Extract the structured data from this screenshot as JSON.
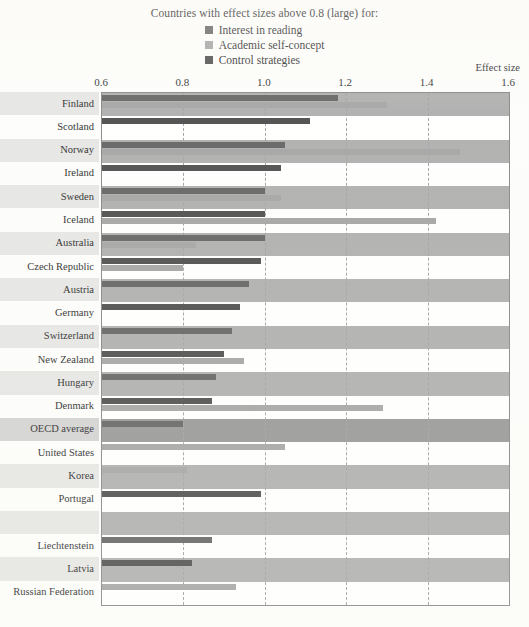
{
  "legend": {
    "title": "Countries with effect sizes above 0.8 (large) for:",
    "entries": [
      {
        "label": "Interest in reading",
        "color": "#575757",
        "swatch": "legend-swatch-interest-in-reading"
      },
      {
        "label": "Academic self-concept",
        "color": "#9d9d9d",
        "swatch": "legend-swatch-academic-self-concept"
      },
      {
        "label": "Control strategies",
        "color": "#3f3f3f",
        "swatch": "legend-swatch-control-strategies"
      }
    ]
  },
  "axis": {
    "title": "Effect size",
    "ticks": [
      "0.6",
      "0.8",
      "1.0",
      "1.2",
      "1.4",
      "1.6"
    ],
    "gridlines": [
      "0.8",
      "1.0",
      "1.2",
      "1.4"
    ]
  },
  "chart_data": {
    "type": "bar",
    "title": "Countries with effect sizes above 0.8 (large) for:",
    "xlabel": "Effect size",
    "ylabel": "",
    "orientation": "horizontal",
    "xlim": [
      0.6,
      1.6
    ],
    "xticks": [
      0.6,
      0.8,
      1.0,
      1.2,
      1.4,
      1.6
    ],
    "grid": true,
    "legend_position": "top-center",
    "series": [
      {
        "name": "Interest in reading",
        "color": "#575757"
      },
      {
        "name": "Academic self-concept",
        "color": "#9d9d9d"
      },
      {
        "name": "Control strategies",
        "color": "#3f3f3f"
      }
    ],
    "categories": [
      "Finland",
      "Scotland",
      "Norway",
      "Ireland",
      "Sweden",
      "Iceland",
      "Australia",
      "Czech Republic",
      "Austria",
      "Germany",
      "Switzerland",
      "New Zealand",
      "Hungary",
      "Denmark",
      "OECD average",
      "United States",
      "Korea",
      "Portugal",
      "",
      "Liechtenstein",
      "Latvia",
      "Russian Federation"
    ],
    "rows": [
      {
        "country": "Finland",
        "band": "shade",
        "bars": [
          {
            "series": "Interest in reading",
            "value": 1.18
          },
          {
            "series": "Academic self-concept",
            "value": 1.3
          }
        ]
      },
      {
        "country": "Scotland",
        "band": "light",
        "bars": [
          {
            "series": "Control strategies",
            "value": 1.11
          }
        ]
      },
      {
        "country": "Norway",
        "band": "shade",
        "bars": [
          {
            "series": "Interest in reading",
            "value": 1.05
          },
          {
            "series": "Academic self-concept",
            "value": 1.48
          }
        ]
      },
      {
        "country": "Ireland",
        "band": "light",
        "bars": [
          {
            "series": "Control strategies",
            "value": 1.04
          }
        ]
      },
      {
        "country": "Sweden",
        "band": "shade",
        "bars": [
          {
            "series": "Interest in reading",
            "value": 1.0
          },
          {
            "series": "Academic self-concept",
            "value": 1.04
          }
        ]
      },
      {
        "country": "Iceland",
        "band": "light",
        "bars": [
          {
            "series": "Control strategies",
            "value": 1.0
          },
          {
            "series": "Academic self-concept",
            "value": 1.42
          }
        ]
      },
      {
        "country": "Australia",
        "band": "shade",
        "bars": [
          {
            "series": "Interest in reading",
            "value": 1.0
          },
          {
            "series": "Academic self-concept",
            "value": 0.83
          }
        ]
      },
      {
        "country": "Czech Republic",
        "band": "light",
        "bars": [
          {
            "series": "Control strategies",
            "value": 0.99
          },
          {
            "series": "Academic self-concept",
            "value": 0.8
          }
        ]
      },
      {
        "country": "Austria",
        "band": "shade",
        "bars": [
          {
            "series": "Interest in reading",
            "value": 0.96
          }
        ]
      },
      {
        "country": "Germany",
        "band": "light",
        "bars": [
          {
            "series": "Control strategies",
            "value": 0.94
          }
        ]
      },
      {
        "country": "Switzerland",
        "band": "shade",
        "bars": [
          {
            "series": "Interest in reading",
            "value": 0.92
          }
        ]
      },
      {
        "country": "New Zealand",
        "band": "light",
        "bars": [
          {
            "series": "Control strategies",
            "value": 0.9
          },
          {
            "series": "Academic self-concept",
            "value": 0.95
          }
        ]
      },
      {
        "country": "Hungary",
        "band": "shade",
        "bars": [
          {
            "series": "Interest in reading",
            "value": 0.88
          }
        ]
      },
      {
        "country": "Denmark",
        "band": "light",
        "bars": [
          {
            "series": "Control strategies",
            "value": 0.87
          },
          {
            "series": "Academic self-concept",
            "value": 1.29
          }
        ]
      },
      {
        "country": "OECD average",
        "band": "dark",
        "bars": [
          {
            "series": "Interest in reading",
            "value": 0.8
          }
        ]
      },
      {
        "country": "United States",
        "band": "light",
        "bars": [
          {
            "series": "Academic self-concept",
            "value": 1.05
          }
        ]
      },
      {
        "country": "Korea",
        "band": "shade",
        "bars": [
          {
            "series": "Academic self-concept",
            "value": 0.81
          }
        ]
      },
      {
        "country": "Portugal",
        "band": "light",
        "bars": [
          {
            "series": "Control strategies",
            "value": 0.99
          }
        ]
      },
      {
        "country": "",
        "band": "shade",
        "bars": []
      },
      {
        "country": "Liechtenstein",
        "band": "light",
        "bars": [
          {
            "series": "Interest in reading",
            "value": 0.87
          }
        ]
      },
      {
        "country": "Latvia",
        "band": "shade",
        "bars": [
          {
            "series": "Control strategies",
            "value": 0.82
          }
        ]
      },
      {
        "country": "Russian Federation",
        "band": "light",
        "bars": [
          {
            "series": "Academic self-concept",
            "value": 0.93
          }
        ]
      }
    ]
  },
  "colors": {
    "interest": "#575757",
    "academic": "#9d9d9d",
    "control": "#3f3f3f",
    "band_shade": "#a8a8a8",
    "band_light": "#ffffff",
    "band_dark": "#8f8f8f",
    "frame": "#7d7d7d",
    "gridline": "#9a9a9a"
  }
}
